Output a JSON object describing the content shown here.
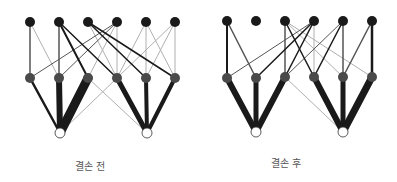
{
  "colors": {
    "background": "#ffffff",
    "top_node": "#1a1a1a",
    "mid_node": "#4a4a4a",
    "bottom_node_fill": "#ffffff",
    "bottom_node_stroke": "#333333",
    "edge_dark": "#1a1a1a",
    "edge_mid": "#555555",
    "edge_light": "#b0b0b0"
  },
  "diagrams": [
    {
      "caption": "결손 전",
      "caption_pos": [
        90,
        158
      ],
      "nodes": {
        "top": [
          [
            30,
            22
          ],
          [
            59,
            22
          ],
          [
            88,
            22
          ],
          [
            117,
            22
          ],
          [
            146,
            22
          ],
          [
            175,
            22
          ]
        ],
        "mid": [
          [
            30,
            78
          ],
          [
            59,
            78
          ],
          [
            88,
            78
          ],
          [
            117,
            78
          ],
          [
            146,
            78
          ],
          [
            175,
            78
          ]
        ],
        "bottom": [
          [
            60,
            133
          ],
          [
            147,
            133
          ]
        ]
      },
      "edges": [
        {
          "from": [
            "top",
            0
          ],
          "to": [
            "mid",
            0
          ],
          "w": 1.5,
          "c": "edge_mid"
        },
        {
          "from": [
            "top",
            0
          ],
          "to": [
            "mid",
            1
          ],
          "w": 1,
          "c": "edge_light"
        },
        {
          "from": [
            "top",
            1
          ],
          "to": [
            "mid",
            1
          ],
          "w": 1.5,
          "c": "edge_mid"
        },
        {
          "from": [
            "top",
            1
          ],
          "to": [
            "mid",
            2
          ],
          "w": 2,
          "c": "edge_dark"
        },
        {
          "from": [
            "top",
            1
          ],
          "to": [
            "mid",
            3
          ],
          "w": 1.5,
          "c": "edge_dark"
        },
        {
          "from": [
            "top",
            2
          ],
          "to": [
            "mid",
            3
          ],
          "w": 1,
          "c": "edge_light"
        },
        {
          "from": [
            "top",
            2
          ],
          "to": [
            "mid",
            4
          ],
          "w": 1.5,
          "c": "edge_dark"
        },
        {
          "from": [
            "top",
            2
          ],
          "to": [
            "mid",
            5
          ],
          "w": 1.5,
          "c": "edge_dark"
        },
        {
          "from": [
            "top",
            3
          ],
          "to": [
            "mid",
            0
          ],
          "w": 1,
          "c": "edge_mid"
        },
        {
          "from": [
            "top",
            3
          ],
          "to": [
            "mid",
            1
          ],
          "w": 1,
          "c": "edge_mid"
        },
        {
          "from": [
            "top",
            3
          ],
          "to": [
            "mid",
            2
          ],
          "w": 1,
          "c": "edge_light"
        },
        {
          "from": [
            "top",
            3
          ],
          "to": [
            "mid",
            3
          ],
          "w": 1,
          "c": "edge_light"
        },
        {
          "from": [
            "top",
            4
          ],
          "to": [
            "mid",
            3
          ],
          "w": 1,
          "c": "edge_light"
        },
        {
          "from": [
            "top",
            4
          ],
          "to": [
            "mid",
            4
          ],
          "w": 1,
          "c": "edge_light"
        },
        {
          "from": [
            "top",
            4
          ],
          "to": [
            "mid",
            5
          ],
          "w": 1,
          "c": "edge_light"
        },
        {
          "from": [
            "top",
            5
          ],
          "to": [
            "mid",
            3
          ],
          "w": 1,
          "c": "edge_light"
        },
        {
          "from": [
            "top",
            5
          ],
          "to": [
            "mid",
            4
          ],
          "w": 1,
          "c": "edge_light"
        },
        {
          "from": [
            "top",
            5
          ],
          "to": [
            "mid",
            5
          ],
          "w": 1,
          "c": "edge_light"
        },
        {
          "from": [
            "mid",
            0
          ],
          "to": [
            "bottom",
            0
          ],
          "w": 2.5,
          "c": "edge_dark"
        },
        {
          "from": [
            "mid",
            1
          ],
          "to": [
            "bottom",
            0
          ],
          "w": 6,
          "c": "edge_dark"
        },
        {
          "from": [
            "mid",
            2
          ],
          "to": [
            "bottom",
            0
          ],
          "w": 9,
          "c": "edge_dark"
        },
        {
          "from": [
            "mid",
            2
          ],
          "to": [
            "bottom",
            1
          ],
          "w": 1,
          "c": "edge_light"
        },
        {
          "from": [
            "mid",
            3
          ],
          "to": [
            "bottom",
            0
          ],
          "w": 1,
          "c": "edge_light"
        },
        {
          "from": [
            "mid",
            3
          ],
          "to": [
            "bottom",
            1
          ],
          "w": 5,
          "c": "edge_dark"
        },
        {
          "from": [
            "mid",
            4
          ],
          "to": [
            "bottom",
            1
          ],
          "w": 4,
          "c": "edge_dark"
        },
        {
          "from": [
            "mid",
            5
          ],
          "to": [
            "bottom",
            1
          ],
          "w": 4,
          "c": "edge_dark"
        }
      ]
    },
    {
      "caption": "결손 후",
      "caption_pos": [
        286,
        155
      ],
      "nodes": {
        "top": [
          [
            227,
            21
          ],
          [
            256,
            21
          ],
          [
            285,
            21
          ],
          [
            314,
            21
          ],
          [
            343,
            21
          ],
          [
            372,
            21
          ]
        ],
        "mid": [
          [
            227,
            78
          ],
          [
            256,
            78
          ],
          [
            285,
            77
          ],
          [
            314,
            77
          ],
          [
            343,
            77
          ],
          [
            372,
            77
          ]
        ],
        "bottom": [
          [
            256,
            132
          ],
          [
            343,
            132
          ]
        ]
      },
      "edges": [
        {
          "from": [
            "top",
            0
          ],
          "to": [
            "mid",
            0
          ],
          "w": 2,
          "c": "edge_dark"
        },
        {
          "from": [
            "top",
            0
          ],
          "to": [
            "mid",
            1
          ],
          "w": 1.5,
          "c": "edge_mid"
        },
        {
          "from": [
            "top",
            2
          ],
          "to": [
            "mid",
            2
          ],
          "w": 1.5,
          "c": "edge_mid"
        },
        {
          "from": [
            "top",
            2
          ],
          "to": [
            "mid",
            3
          ],
          "w": 1.5,
          "c": "edge_dark"
        },
        {
          "from": [
            "top",
            2
          ],
          "to": [
            "mid",
            4
          ],
          "w": 1,
          "c": "edge_light"
        },
        {
          "from": [
            "top",
            2
          ],
          "to": [
            "mid",
            5
          ],
          "w": 1,
          "c": "edge_light"
        },
        {
          "from": [
            "top",
            3
          ],
          "to": [
            "mid",
            0
          ],
          "w": 1,
          "c": "edge_mid"
        },
        {
          "from": [
            "top",
            3
          ],
          "to": [
            "mid",
            1
          ],
          "w": 1.5,
          "c": "edge_dark"
        },
        {
          "from": [
            "top",
            3
          ],
          "to": [
            "mid",
            2
          ],
          "w": 1.5,
          "c": "edge_dark"
        },
        {
          "from": [
            "top",
            3
          ],
          "to": [
            "mid",
            3
          ],
          "w": 1,
          "c": "edge_light"
        },
        {
          "from": [
            "top",
            4
          ],
          "to": [
            "mid",
            2
          ],
          "w": 1,
          "c": "edge_mid"
        },
        {
          "from": [
            "top",
            4
          ],
          "to": [
            "mid",
            3
          ],
          "w": 1.5,
          "c": "edge_dark"
        },
        {
          "from": [
            "top",
            4
          ],
          "to": [
            "mid",
            4
          ],
          "w": 1.5,
          "c": "edge_mid"
        },
        {
          "from": [
            "top",
            5
          ],
          "to": [
            "mid",
            4
          ],
          "w": 1.5,
          "c": "edge_mid"
        },
        {
          "from": [
            "top",
            5
          ],
          "to": [
            "mid",
            5
          ],
          "w": 2.5,
          "c": "edge_dark"
        },
        {
          "from": [
            "mid",
            0
          ],
          "to": [
            "bottom",
            0
          ],
          "w": 6,
          "c": "edge_dark"
        },
        {
          "from": [
            "mid",
            1
          ],
          "to": [
            "bottom",
            0
          ],
          "w": 5,
          "c": "edge_dark"
        },
        {
          "from": [
            "mid",
            2
          ],
          "to": [
            "bottom",
            0
          ],
          "w": 6,
          "c": "edge_dark"
        },
        {
          "from": [
            "mid",
            2
          ],
          "to": [
            "bottom",
            1
          ],
          "w": 1,
          "c": "edge_light"
        },
        {
          "from": [
            "mid",
            3
          ],
          "to": [
            "bottom",
            1
          ],
          "w": 6,
          "c": "edge_dark"
        },
        {
          "from": [
            "mid",
            4
          ],
          "to": [
            "bottom",
            1
          ],
          "w": 5,
          "c": "edge_dark"
        },
        {
          "from": [
            "mid",
            5
          ],
          "to": [
            "bottom",
            1
          ],
          "w": 7,
          "c": "edge_dark"
        }
      ]
    }
  ]
}
